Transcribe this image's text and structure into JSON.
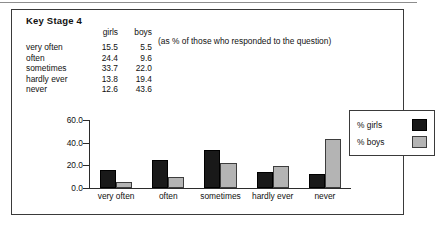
{
  "figure": {
    "title": "Key Stage 4",
    "note": "(as % of those who responded to the question)"
  },
  "table": {
    "headers": [
      "",
      "girls",
      "boys"
    ],
    "rows": [
      {
        "category": "very often",
        "girls": "15.5",
        "boys": "5.5"
      },
      {
        "category": "often",
        "girls": "24.4",
        "boys": "9.6"
      },
      {
        "category": "sometimes",
        "girls": "33.7",
        "boys": "22.0"
      },
      {
        "category": "hardly ever",
        "girls": "13.8",
        "boys": "19.4"
      },
      {
        "category": "never",
        "girls": "12.6",
        "boys": "43.6"
      }
    ]
  },
  "legend": {
    "items": [
      {
        "label": "% girls",
        "color": "#191919"
      },
      {
        "label": "% boys",
        "color": "#b4b4b4"
      }
    ]
  },
  "chart_data": {
    "type": "bar",
    "title": "Key Stage 4",
    "subtitle": "(as % of those who responded to the question)",
    "categories": [
      "very often",
      "often",
      "sometimes",
      "hardly ever",
      "never"
    ],
    "series": [
      {
        "name": "% girls",
        "color": "#191919",
        "values": [
          15.5,
          24.4,
          33.7,
          13.8,
          12.6
        ]
      },
      {
        "name": "% boys",
        "color": "#b4b4b4",
        "values": [
          5.5,
          9.6,
          22.0,
          19.4,
          43.6
        ]
      }
    ],
    "xlabel": "",
    "ylabel": "",
    "ylim": [
      0,
      60
    ],
    "yticks": [
      "0.0",
      "20.0",
      "40.0",
      "60.0"
    ],
    "ytick_values": [
      0,
      20,
      40,
      60
    ],
    "grid": false,
    "legend_position": "top-right"
  }
}
